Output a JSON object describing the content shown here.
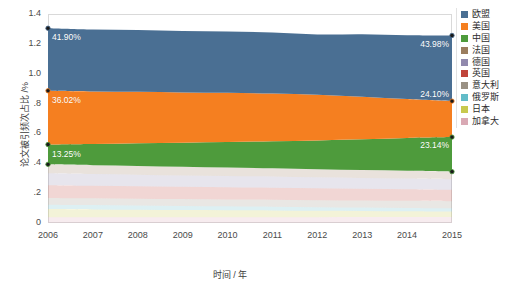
{
  "chart_data": {
    "type": "area",
    "title": "",
    "xlabel": "时间 / 年",
    "ylabel": "论文被引频次占比 /%",
    "stacked": true,
    "grid": false,
    "legend_position": "right",
    "xlim": [
      2006,
      2015
    ],
    "ylim": [
      0,
      1.4
    ],
    "x": [
      2006,
      2007,
      2008,
      2009,
      2010,
      2011,
      2012,
      2013,
      2014,
      2015
    ],
    "xtick_labels": [
      "2006",
      "2007",
      "2008",
      "2009",
      "2010",
      "2011",
      "2012",
      "2013",
      "2014",
      "2015"
    ],
    "ytick_labels": [
      "1.4",
      "1.2",
      "1.0",
      ".8",
      ".6",
      ".4",
      ".2",
      "0"
    ],
    "ytick_values": [
      1.4,
      1.2,
      1.0,
      0.8,
      0.6,
      0.4,
      0.2,
      0
    ],
    "series": [
      {
        "name": "欧盟",
        "color": "#4a6f93",
        "values": [
          0.419,
          0.415,
          0.414,
          0.411,
          0.41,
          0.409,
          0.404,
          0.418,
          0.428,
          0.4398
        ]
      },
      {
        "name": "美国",
        "color": "#f57f20",
        "values": [
          0.3602,
          0.352,
          0.345,
          0.337,
          0.329,
          0.32,
          0.306,
          0.285,
          0.26,
          0.241
        ]
      },
      {
        "name": "中国",
        "color": "#4e9b3c",
        "values": [
          0.1325,
          0.142,
          0.152,
          0.162,
          0.172,
          0.181,
          0.193,
          0.206,
          0.22,
          0.2314
        ]
      },
      {
        "name": "法国",
        "color": "#9b7d5e",
        "values": [
          0.06,
          0.059,
          0.058,
          0.057,
          0.056,
          0.055,
          0.054,
          0.053,
          0.052,
          0.051
        ]
      },
      {
        "name": "德国",
        "color": "#9189ad",
        "values": [
          0.08,
          0.079,
          0.078,
          0.077,
          0.076,
          0.075,
          0.074,
          0.073,
          0.072,
          0.071
        ]
      },
      {
        "name": "英国",
        "color": "#c0443a",
        "values": [
          0.085,
          0.084,
          0.083,
          0.082,
          0.081,
          0.08,
          0.079,
          0.078,
          0.077,
          0.076
        ]
      },
      {
        "name": "意大利",
        "color": "#9a9184",
        "values": [
          0.045,
          0.045,
          0.046,
          0.046,
          0.046,
          0.047,
          0.047,
          0.047,
          0.048,
          0.048
        ]
      },
      {
        "name": "俄罗斯",
        "color": "#62bcc8",
        "values": [
          0.03,
          0.029,
          0.028,
          0.027,
          0.026,
          0.025,
          0.024,
          0.023,
          0.022,
          0.021
        ]
      },
      {
        "name": "日本",
        "color": "#c8c94e",
        "values": [
          0.055,
          0.053,
          0.051,
          0.049,
          0.047,
          0.045,
          0.043,
          0.041,
          0.039,
          0.037
        ]
      },
      {
        "name": "加拿大",
        "color": "#d9a9b4",
        "values": [
          0.038,
          0.038,
          0.038,
          0.038,
          0.039,
          0.039,
          0.039,
          0.04,
          0.04,
          0.04
        ]
      }
    ],
    "annotations": [
      {
        "text": "41.90%",
        "series": "欧盟",
        "x": 2006
      },
      {
        "text": "43.98%",
        "series": "欧盟",
        "x": 2015
      },
      {
        "text": "36.02%",
        "series": "美国",
        "x": 2006
      },
      {
        "text": "24.10%",
        "series": "美国",
        "x": 2015
      },
      {
        "text": "13.25%",
        "series": "中国",
        "x": 2006
      },
      {
        "text": "23.14%",
        "series": "中国",
        "x": 2015
      }
    ]
  },
  "axes": {
    "ylabel": "论文被引频次占比 /%",
    "xlabel": "时间 / 年",
    "yticks": [
      "1.4",
      "1.2",
      "1.0",
      ".8",
      ".6",
      ".4",
      ".2",
      "0"
    ],
    "xticks": [
      "2006",
      "2007",
      "2008",
      "2009",
      "2010",
      "2011",
      "2012",
      "2013",
      "2014",
      "2015"
    ]
  },
  "legend": {
    "items": [
      {
        "label": "欧盟",
        "color": "#4a6f93"
      },
      {
        "label": "美国",
        "color": "#f57f20"
      },
      {
        "label": "中国",
        "color": "#4e9b3c"
      },
      {
        "label": "法国",
        "color": "#9b7d5e"
      },
      {
        "label": "德国",
        "color": "#9189ad"
      },
      {
        "label": "英国",
        "color": "#c0443a"
      },
      {
        "label": "意大利",
        "color": "#9a9184"
      },
      {
        "label": "俄罗斯",
        "color": "#62bcc8"
      },
      {
        "label": "日本",
        "color": "#c8c94e"
      },
      {
        "label": "加拿大",
        "color": "#d9a9b4"
      }
    ]
  },
  "labels": {
    "eu_start": "41.90%",
    "eu_end": "43.98%",
    "us_start": "36.02%",
    "us_end": "24.10%",
    "cn_start": "13.25%",
    "cn_end": "23.14%"
  }
}
